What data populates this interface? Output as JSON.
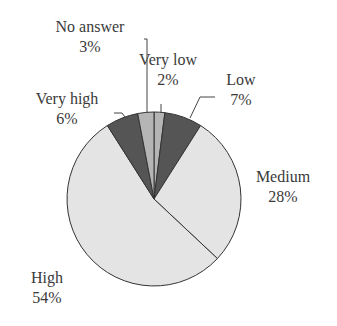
{
  "chart_data": {
    "type": "pie",
    "title": "",
    "start": "12 o'clock, clockwise",
    "slices": [
      {
        "name": "Very low",
        "label": "Very low",
        "pct_label": "2%",
        "value": 2,
        "color": "#b5b5b5"
      },
      {
        "name": "Low",
        "label": "Low",
        "pct_label": "7%",
        "value": 7,
        "color": "#555555"
      },
      {
        "name": "Medium",
        "label": "Medium",
        "pct_label": "28%",
        "value": 28,
        "color": "#e4e4e4"
      },
      {
        "name": "High",
        "label": "High",
        "pct_label": "54%",
        "value": 54,
        "color": "#e4e4e4"
      },
      {
        "name": "Very high",
        "label": "Very high",
        "pct_label": "6%",
        "value": 6,
        "color": "#555555"
      },
      {
        "name": "No answer",
        "label": "No answer",
        "pct_label": "3%",
        "value": 3,
        "color": "#b5b5b5"
      }
    ],
    "legend": "none (direct labels)"
  }
}
